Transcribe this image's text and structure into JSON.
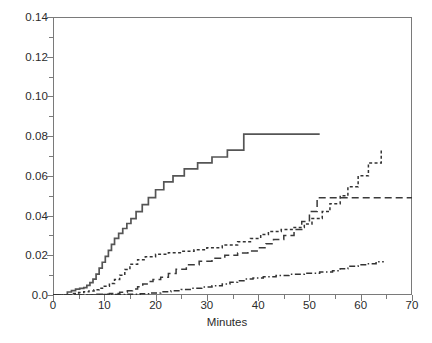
{
  "chart_data": {
    "type": "line",
    "title": "",
    "subtitle": "",
    "xlabel": "Minutes",
    "ylabel": "",
    "xlim": [
      0,
      70
    ],
    "ylim": [
      0,
      0.14
    ],
    "grid": false,
    "legend": null,
    "drawstyle": "steps-post",
    "xticks": [
      0,
      10,
      20,
      30,
      40,
      50,
      60,
      70
    ],
    "xticklabels": [
      "0",
      "10",
      "20",
      "30",
      "40",
      "50",
      "60",
      "70"
    ],
    "xminorticks": [
      5,
      15,
      25,
      35,
      45,
      55,
      65
    ],
    "yticks": [
      0.0,
      0.02,
      0.04,
      0.06,
      0.08,
      0.1,
      0.12,
      0.14
    ],
    "yticklabels": [
      "0.0",
      "0.02",
      "0.04",
      "0.06",
      "0.08",
      "0.10",
      "0.12",
      "0.14"
    ],
    "series": [
      {
        "name": "curve-1",
        "style": "solid",
        "color": "#555555",
        "x": [
          0,
          2.0,
          2.8,
          3.6,
          4.4,
          5.2,
          6.0,
          6.6,
          7.2,
          7.8,
          8.4,
          9.0,
          9.6,
          10.2,
          10.8,
          11.4,
          12.0,
          12.8,
          13.6,
          14.4,
          15.2,
          16.2,
          17.4,
          18.6,
          20.0,
          21.6,
          23.4,
          25.6,
          28.2,
          31.0,
          34.0,
          37.2,
          52.0
        ],
        "y": [
          0.0,
          0.0,
          0.0015,
          0.0022,
          0.003,
          0.0033,
          0.0037,
          0.0048,
          0.0062,
          0.008,
          0.0105,
          0.0135,
          0.0165,
          0.0195,
          0.0225,
          0.0255,
          0.0285,
          0.031,
          0.0335,
          0.036,
          0.0385,
          0.042,
          0.0455,
          0.049,
          0.053,
          0.057,
          0.06,
          0.0635,
          0.0665,
          0.0695,
          0.073,
          0.081,
          0.081
        ]
      },
      {
        "name": "curve-2",
        "style": "dashed-short",
        "color": "#333333",
        "x": [
          0,
          3.0,
          4.0,
          5.0,
          6.0,
          7.0,
          8.0,
          9.0,
          10.0,
          11.0,
          12.0,
          13.0,
          14.0,
          15.0,
          16.5,
          18.0,
          20.0,
          22.5,
          25.0,
          27.5,
          30.0,
          33.0,
          36.0,
          38.5,
          40.5,
          42.0,
          44.5,
          47.0,
          49.0,
          50.5,
          52.5,
          54.0,
          56.0,
          57.5,
          59.5,
          61.5,
          64.0
        ],
        "y": [
          0.0,
          0.0,
          0.0008,
          0.0012,
          0.0016,
          0.002,
          0.0026,
          0.0034,
          0.0044,
          0.0058,
          0.0078,
          0.01,
          0.0128,
          0.0155,
          0.0178,
          0.0193,
          0.0205,
          0.0213,
          0.022,
          0.0228,
          0.0238,
          0.0252,
          0.0268,
          0.0285,
          0.0305,
          0.032,
          0.033,
          0.034,
          0.0358,
          0.0385,
          0.042,
          0.046,
          0.05,
          0.0545,
          0.06,
          0.0665,
          0.073
        ]
      },
      {
        "name": "curve-3",
        "style": "dashed-long",
        "color": "#3a3a3a",
        "x": [
          0,
          5.0,
          8.0,
          11.0,
          13.0,
          14.5,
          15.5,
          16.5,
          17.5,
          18.5,
          19.5,
          21.0,
          22.5,
          24.0,
          26.0,
          28.5,
          31.0,
          33.5,
          36.0,
          38.0,
          40.0,
          41.5,
          43.0,
          45.0,
          47.0,
          48.5,
          50.0,
          51.5,
          70.0
        ],
        "y": [
          0.0,
          0.0,
          0.0004,
          0.0008,
          0.0014,
          0.0022,
          0.003,
          0.0042,
          0.0056,
          0.0068,
          0.0078,
          0.009,
          0.0108,
          0.013,
          0.0152,
          0.017,
          0.0185,
          0.02,
          0.0212,
          0.0222,
          0.0238,
          0.0258,
          0.028,
          0.03,
          0.033,
          0.037,
          0.042,
          0.049,
          0.049
        ]
      },
      {
        "name": "curve-4",
        "style": "dash-dot",
        "color": "#333333",
        "x": [
          0,
          6.0,
          10.0,
          14.0,
          17.0,
          19.0,
          21.0,
          23.0,
          25.0,
          27.0,
          29.0,
          31.0,
          33.0,
          34.5,
          36.0,
          37.5,
          39.0,
          41.0,
          43.5,
          46.0,
          49.0,
          52.0,
          54.5,
          56.0,
          57.5,
          59.5,
          61.5,
          63.0,
          64.5
        ],
        "y": [
          0.0,
          0.0,
          0.0002,
          0.0004,
          0.0006,
          0.001,
          0.0016,
          0.0022,
          0.0028,
          0.0034,
          0.004,
          0.0046,
          0.0055,
          0.0064,
          0.0072,
          0.008,
          0.0086,
          0.0092,
          0.0098,
          0.0104,
          0.011,
          0.0116,
          0.0122,
          0.0132,
          0.0145,
          0.0152,
          0.0158,
          0.0168,
          0.0168
        ]
      }
    ],
    "annotations": []
  },
  "axis": {
    "x_title": "Minutes"
  },
  "caption": {
    "fragment": ""
  }
}
